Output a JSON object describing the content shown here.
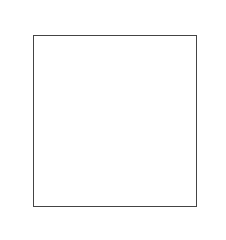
{
  "puzzle": {
    "rows": 5,
    "cols": 5,
    "top_dot_clues": [
      3,
      1,
      2,
      0,
      3
    ],
    "left_dot_clues": [
      1,
      2,
      1,
      1,
      4
    ],
    "right_sum_clues": [
      "8",
      "3",
      "7",
      "9",
      "16"
    ],
    "bottom_sum_clues": [
      "16",
      "9",
      "9",
      "0",
      "9"
    ],
    "cells": [
      [
        "",
        "",
        "",
        "",
        ""
      ],
      [
        "",
        "",
        "",
        "",
        ""
      ],
      [
        "",
        "",
        "",
        "",
        ""
      ],
      [
        "",
        "",
        "",
        "",
        ""
      ],
      [
        "",
        "",
        "",
        "",
        ""
      ]
    ]
  }
}
